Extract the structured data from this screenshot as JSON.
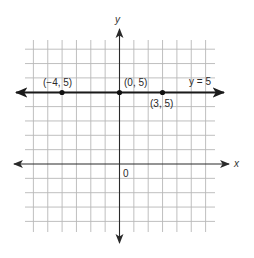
{
  "figure": {
    "type": "coordinate-plane",
    "axes": {
      "x_label": "x",
      "y_label": "y",
      "origin_label": "0"
    },
    "grid": {
      "x_range": [
        -6,
        6
      ],
      "y_range": [
        -4,
        8
      ],
      "step": 1
    },
    "line": {
      "equation_label": "y = 5",
      "y_value": 5
    },
    "points": [
      {
        "label": "(−4, 5)",
        "x": -4,
        "y": 5
      },
      {
        "label": "(0, 5)",
        "x": 0,
        "y": 5
      },
      {
        "label": "(3, 5)",
        "x": 3,
        "y": 5
      }
    ]
  }
}
